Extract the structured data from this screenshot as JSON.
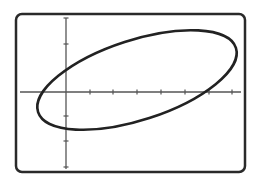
{
  "diagram": {
    "type": "graphing-calculator-screen",
    "colors": {
      "background": "#ffffff",
      "frame": "#2a2a2a",
      "axes": "#555555",
      "curve": "#222222"
    },
    "frame": {
      "x": 16,
      "y": 14,
      "width": 229,
      "height": 158,
      "radius": 6
    },
    "origin": {
      "x": 66,
      "y": 92
    },
    "x_axis": {
      "from": 20,
      "to": 241,
      "ticks_px": [
        90,
        113,
        137,
        161,
        185,
        209,
        232
      ]
    },
    "y_axis": {
      "from": 18,
      "to": 169,
      "ticks_px": [
        18,
        44,
        116,
        141,
        167
      ]
    },
    "ellipse": {
      "cx": 137,
      "cy": 80,
      "rx": 104,
      "ry": 40,
      "rotation_deg": -18
    }
  }
}
